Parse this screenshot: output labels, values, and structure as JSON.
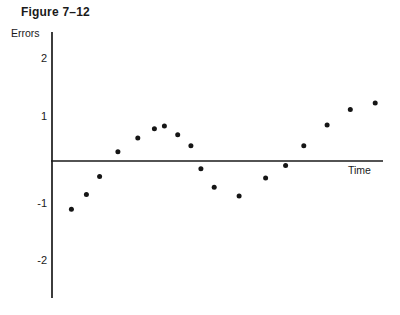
{
  "figure": {
    "title": "Figure 7–12",
    "ink_color": "#1a1a1a"
  },
  "chart_data": {
    "type": "scatter",
    "title": "Figure 7–12",
    "xlabel": "Time",
    "ylabel": "Errors",
    "grid": false,
    "legend": "none",
    "marker": {
      "shape": "filled-circle",
      "color": "#151515",
      "radius_px": 2.5
    },
    "x_axis": {
      "label": "Time",
      "range": [
        0,
        10
      ],
      "tick_labels_visible": false
    },
    "y_axis": {
      "label": "Errors",
      "range": [
        -2.7,
        2.7
      ],
      "ticks": [
        2,
        1,
        -1,
        -2
      ]
    },
    "points": [
      {
        "t": 0.6,
        "error": -1.05
      },
      {
        "t": 1.05,
        "error": -0.73
      },
      {
        "t": 1.45,
        "error": -0.34
      },
      {
        "t": 2.0,
        "error": 0.2
      },
      {
        "t": 2.6,
        "error": 0.5
      },
      {
        "t": 3.1,
        "error": 0.7
      },
      {
        "t": 3.4,
        "error": 0.76
      },
      {
        "t": 3.8,
        "error": 0.57
      },
      {
        "t": 4.2,
        "error": 0.33
      },
      {
        "t": 4.5,
        "error": -0.17
      },
      {
        "t": 4.9,
        "error": -0.57
      },
      {
        "t": 5.65,
        "error": -0.76
      },
      {
        "t": 6.45,
        "error": -0.37
      },
      {
        "t": 7.05,
        "error": -0.1
      },
      {
        "t": 7.6,
        "error": 0.33
      },
      {
        "t": 8.3,
        "error": 0.78
      },
      {
        "t": 9.0,
        "error": 1.12
      },
      {
        "t": 9.75,
        "error": 1.26
      }
    ]
  }
}
